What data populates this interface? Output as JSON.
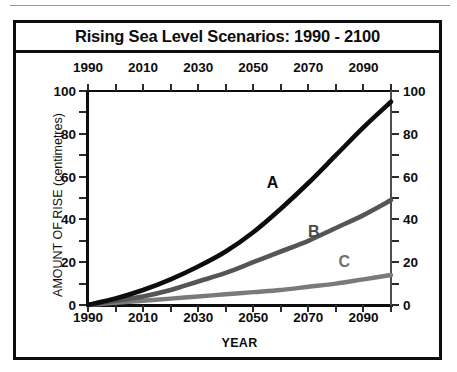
{
  "figure": {
    "title": "Rising Sea Level Scenarios: 1990 - 2100"
  },
  "chart_data": {
    "type": "line",
    "title": "Rising Sea Level Scenarios: 1990 - 2100",
    "xlabel": "YEAR",
    "ylabel": "AMOUNT OF RISE (centimetres)",
    "xlim": [
      1990,
      2100
    ],
    "ylim": [
      0,
      100
    ],
    "grid": false,
    "legend_position": "inline-annotations",
    "x_tick_labels": [
      "1990",
      "2010",
      "2030",
      "2050",
      "2070",
      "2090"
    ],
    "x_tick_values": [
      1990,
      2010,
      2030,
      2050,
      2070,
      2090
    ],
    "x_minor_tick_values": [
      1990,
      2000,
      2010,
      2020,
      2030,
      2040,
      2050,
      2060,
      2070,
      2080,
      2090,
      2100
    ],
    "y_tick_labels": [
      "0",
      "20",
      "40",
      "60",
      "80",
      "100"
    ],
    "y_tick_values": [
      0,
      20,
      40,
      60,
      80,
      100
    ],
    "y_minor_tick_values": [
      0,
      10,
      20,
      30,
      40,
      50,
      60,
      70,
      80,
      90,
      100
    ],
    "top_axis_labels": [
      "1990",
      "2010",
      "2030",
      "2050",
      "2070",
      "2090"
    ],
    "right_axis_labels": [
      "0",
      "20",
      "40",
      "60",
      "80",
      "100"
    ],
    "x": [
      1990,
      2000,
      2010,
      2020,
      2030,
      2040,
      2050,
      2060,
      2070,
      2080,
      2090,
      2100
    ],
    "series": [
      {
        "name": "A",
        "color": "#0d0d0d",
        "values": [
          0,
          3,
          7,
          12,
          18,
          25,
          34,
          45,
          57,
          70,
          83,
          95
        ]
      },
      {
        "name": "B",
        "color": "#555555",
        "values": [
          0,
          2,
          4,
          7,
          11,
          15,
          20,
          25,
          30,
          36,
          42,
          49
        ]
      },
      {
        "name": "C",
        "color": "#7a7a7a",
        "values": [
          0,
          1,
          2,
          3,
          4,
          5,
          6,
          7,
          8.5,
          10,
          12,
          14
        ]
      }
    ],
    "annotations": [
      {
        "text": "A",
        "x": 2057,
        "y": 57,
        "color": "#0d0d0d"
      },
      {
        "text": "B",
        "x": 2072,
        "y": 34,
        "color": "#4a4a4a"
      },
      {
        "text": "C",
        "x": 2083,
        "y": 20,
        "color": "#6f6f6f"
      }
    ]
  }
}
